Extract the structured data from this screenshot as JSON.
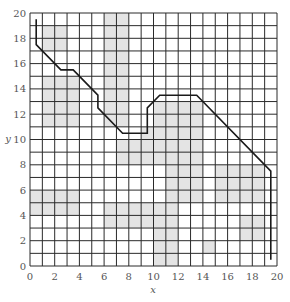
{
  "figure": {
    "xlabel": "x",
    "ylabel": "y",
    "xlim": [
      0,
      20
    ],
    "ylim": [
      0,
      20
    ],
    "xticks": [
      "0",
      "2",
      "4",
      "6",
      "8",
      "10",
      "12",
      "14",
      "16",
      "18",
      "20"
    ],
    "yticks": [
      "0",
      "2",
      "4",
      "6",
      "8",
      "10",
      "12",
      "14",
      "16",
      "18",
      "20"
    ],
    "grid_step": 1,
    "colors": {
      "grid": "#2a2a2a",
      "shade": "#e4e4e4",
      "path": "#1a1a1a",
      "tick_text": "#555555"
    }
  },
  "shaded_cells": [
    {
      "x0": 1,
      "y0": 17,
      "x1": 3,
      "y1": 19
    },
    {
      "x0": 1,
      "y0": 11,
      "x1": 4,
      "y1": 15
    },
    {
      "x0": 6,
      "y0": 11,
      "x1": 8,
      "y1": 20
    },
    {
      "x0": 7,
      "y0": 8,
      "x1": 10,
      "y1": 10
    },
    {
      "x0": 9,
      "y0": 9,
      "x1": 10,
      "y1": 11
    },
    {
      "x0": 10,
      "y0": 8,
      "x1": 14,
      "y1": 13
    },
    {
      "x0": 11,
      "y0": 5,
      "x1": 14,
      "y1": 8
    },
    {
      "x0": 15,
      "y0": 5,
      "x1": 19,
      "y1": 8
    },
    {
      "x0": 0,
      "y0": 4,
      "x1": 4,
      "y1": 6
    },
    {
      "x0": 6,
      "y0": 3,
      "x1": 12,
      "y1": 5
    },
    {
      "x0": 10,
      "y0": 0,
      "x1": 12,
      "y1": 3
    },
    {
      "x0": 14,
      "y0": 1,
      "x1": 15,
      "y1": 2
    },
    {
      "x0": 17,
      "y0": 2,
      "x1": 19,
      "y1": 4
    }
  ],
  "path": [
    [
      0.5,
      19.5
    ],
    [
      0.5,
      17.5
    ],
    [
      2.5,
      15.5
    ],
    [
      3.5,
      15.5
    ],
    [
      5.5,
      13.5
    ],
    [
      5.5,
      12.5
    ],
    [
      7.5,
      10.5
    ],
    [
      9.5,
      10.5
    ],
    [
      9.5,
      12.5
    ],
    [
      10.5,
      13.5
    ],
    [
      13.5,
      13.5
    ],
    [
      19.5,
      7.5
    ],
    [
      19.5,
      0.5
    ]
  ]
}
